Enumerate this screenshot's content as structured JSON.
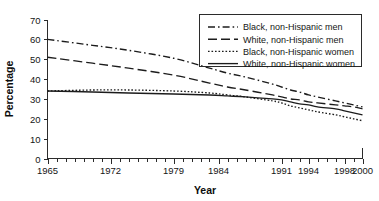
{
  "chart_data": {
    "type": "line",
    "title": "",
    "subtitle": "",
    "xlabel": "Year",
    "ylabel": "Percentage",
    "xlim": [
      1965,
      2000
    ],
    "ylim": [
      0,
      70
    ],
    "yticks": [
      0,
      10,
      20,
      30,
      40,
      50,
      60,
      70
    ],
    "xticks": [
      1965,
      1972,
      1979,
      1984,
      1991,
      1994,
      1998,
      2000
    ],
    "xtick_labels": [
      "1965",
      "1972",
      "1979",
      "1984",
      "1991",
      "1994",
      "1998",
      "2000"
    ],
    "ytick_labels": [
      "0",
      "10",
      "20",
      "30",
      "40",
      "50",
      "60",
      "70"
    ],
    "x_minor_tick_step": 1,
    "grid": false,
    "legend_position": "upper right",
    "x": [
      1965,
      1970,
      1974,
      1979,
      1983,
      1985,
      1987,
      1990,
      1991,
      1992,
      1993,
      1994,
      1995,
      1997,
      1998,
      1999,
      2000
    ],
    "series": [
      {
        "name": "Black, non-Hispanic men",
        "style": "dash-dot",
        "values": [
          60.0,
          57.0,
          54.5,
          50.5,
          45.5,
          43.0,
          41.0,
          37.5,
          36.0,
          34.5,
          33.5,
          32.0,
          31.0,
          29.0,
          28.0,
          27.0,
          26.0
        ]
      },
      {
        "name": "White, non-Hispanic men",
        "style": "long-dash",
        "values": [
          51.0,
          48.0,
          45.5,
          42.0,
          38.0,
          36.0,
          34.5,
          32.0,
          31.0,
          30.0,
          29.5,
          28.5,
          28.0,
          27.0,
          26.5,
          26.0,
          25.0
        ]
      },
      {
        "name": "Black, non-Hispanic women",
        "style": "dotted",
        "values": [
          34.0,
          34.5,
          34.5,
          34.0,
          33.0,
          32.0,
          31.0,
          29.0,
          28.0,
          26.5,
          25.5,
          24.5,
          23.5,
          22.0,
          21.0,
          20.0,
          19.0
        ]
      },
      {
        "name": "White, non-Hispanic women",
        "style": "solid",
        "values": [
          34.0,
          33.5,
          33.0,
          32.5,
          32.0,
          31.5,
          31.0,
          30.0,
          29.5,
          28.5,
          27.5,
          27.0,
          26.0,
          25.0,
          24.0,
          23.0,
          22.0
        ]
      }
    ],
    "colors": {
      "line": "#1c1c1c",
      "axis": "#2b2b2b",
      "background": "#ffffff"
    }
  },
  "legend": {
    "items": [
      {
        "label": "Black, non-Hispanic men"
      },
      {
        "label": "White, non-Hispanic men"
      },
      {
        "label": "Black, non-Hispanic women"
      },
      {
        "label": "White, non-Hispanic women"
      }
    ]
  }
}
